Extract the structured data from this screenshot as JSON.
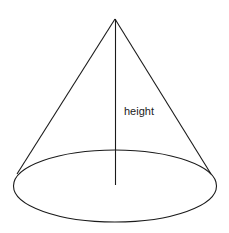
{
  "diagram": {
    "type": "cone",
    "labels": {
      "height": "height"
    },
    "colors": {
      "stroke": "#1a1a1a",
      "background": "#ffffff"
    }
  }
}
